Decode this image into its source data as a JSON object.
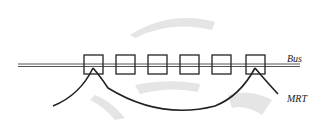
{
  "diagram": {
    "labels": {
      "bus": "Bus",
      "mrt": "MRT"
    },
    "stations_count": 6,
    "colors": {
      "line": "#222222",
      "bus_line": "#555555",
      "stipple": "#cccccc"
    }
  }
}
